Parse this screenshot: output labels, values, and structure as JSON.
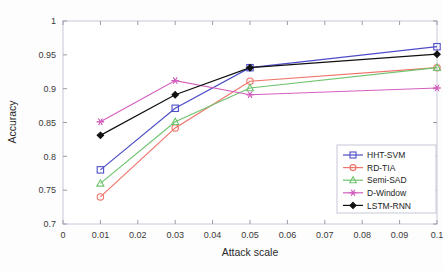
{
  "chart_data": {
    "type": "line",
    "title": "",
    "xlabel": "Attack scale",
    "ylabel": "Accuracy",
    "x": [
      0.01,
      0.03,
      0.05,
      0.1
    ],
    "xlim": [
      0,
      0.1
    ],
    "ylim": [
      0.7,
      1
    ],
    "xticks": [
      0,
      0.01,
      0.02,
      0.03,
      0.04,
      0.05,
      0.06,
      0.07,
      0.08,
      0.09,
      0.1
    ],
    "xticklabels": [
      "0",
      "0.01",
      "0.02",
      "0.03",
      "0.04",
      "0.05",
      "0.06",
      "0.07",
      "0.08",
      "0.09",
      "0.1"
    ],
    "yticks": [
      0.7,
      0.75,
      0.8,
      0.85,
      0.9,
      0.95,
      1
    ],
    "yticklabels": [
      "0.7",
      "0.75",
      "0.8",
      "0.85",
      "0.9",
      "0.95",
      "1"
    ],
    "grid": false,
    "legend_position": "lower right",
    "series": [
      {
        "name": "HHT-SVM",
        "color": "#4e4ec8",
        "marker": "square",
        "values": [
          0.78,
          0.871,
          0.931,
          0.962
        ]
      },
      {
        "name": "RD-TIA",
        "color": "#f0736a",
        "marker": "circle",
        "values": [
          0.74,
          0.842,
          0.911,
          0.931
        ]
      },
      {
        "name": "Semi-SAD",
        "color": "#6fc46f",
        "marker": "triangle",
        "values": [
          0.76,
          0.851,
          0.901,
          0.931
        ]
      },
      {
        "name": "D-Window",
        "color": "#d45fbe",
        "marker": "asterisk",
        "values": [
          0.851,
          0.912,
          0.891,
          0.901
        ]
      },
      {
        "name": "LSTM-RNN",
        "color": "#111111",
        "marker": "diamond",
        "values": [
          0.831,
          0.891,
          0.931,
          0.951
        ]
      }
    ]
  },
  "axes": {
    "frame_color": "#c8c8d8",
    "tick_color": "#9a9aaa"
  }
}
